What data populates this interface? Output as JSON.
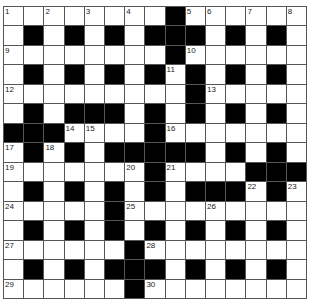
{
  "puzzle": {
    "rows": 15,
    "cols": 15,
    "colors": {
      "black": "#000000",
      "white": "#ffffff",
      "grid_line": "#555555"
    },
    "layout": [
      "########.######",
      "#.#.#.#...#.#.#",
      "########.######",
      "#.#.#.#.#.#.#.#",
      "#########.#####",
      "#.#...#.#.#.#.#",
      "...####.#######",
      "#.#.#.....#.#.#",
      "#######.####...",
      "#.#.#.#.#...#.#",
      "#####.#########",
      "#.#.#.#.#.#.#.#",
      "######.########",
      "#.#.#...#.#.#.#",
      "######.########"
    ],
    "numbers": [
      {
        "r": 0,
        "c": 0,
        "n": "1"
      },
      {
        "r": 0,
        "c": 2,
        "n": "2"
      },
      {
        "r": 0,
        "c": 4,
        "n": "3"
      },
      {
        "r": 0,
        "c": 6,
        "n": "4"
      },
      {
        "r": 0,
        "c": 9,
        "n": "5"
      },
      {
        "r": 0,
        "c": 10,
        "n": "6"
      },
      {
        "r": 0,
        "c": 12,
        "n": "7"
      },
      {
        "r": 0,
        "c": 14,
        "n": "8"
      },
      {
        "r": 2,
        "c": 0,
        "n": "9"
      },
      {
        "r": 2,
        "c": 9,
        "n": "10"
      },
      {
        "r": 3,
        "c": 8,
        "n": "11"
      },
      {
        "r": 4,
        "c": 0,
        "n": "12"
      },
      {
        "r": 4,
        "c": 10,
        "n": "13"
      },
      {
        "r": 6,
        "c": 3,
        "n": "14"
      },
      {
        "r": 6,
        "c": 4,
        "n": "15"
      },
      {
        "r": 6,
        "c": 8,
        "n": "16"
      },
      {
        "r": 7,
        "c": 0,
        "n": "17"
      },
      {
        "r": 7,
        "c": 2,
        "n": "18"
      },
      {
        "r": 8,
        "c": 0,
        "n": "19"
      },
      {
        "r": 8,
        "c": 6,
        "n": "20"
      },
      {
        "r": 8,
        "c": 8,
        "n": "21"
      },
      {
        "r": 9,
        "c": 12,
        "n": "22"
      },
      {
        "r": 9,
        "c": 14,
        "n": "23"
      },
      {
        "r": 10,
        "c": 0,
        "n": "24"
      },
      {
        "r": 10,
        "c": 6,
        "n": "25"
      },
      {
        "r": 10,
        "c": 10,
        "n": "26"
      },
      {
        "r": 12,
        "c": 0,
        "n": "27"
      },
      {
        "r": 12,
        "c": 7,
        "n": "28"
      },
      {
        "r": 14,
        "c": 0,
        "n": "29"
      },
      {
        "r": 14,
        "c": 7,
        "n": "30"
      }
    ]
  }
}
